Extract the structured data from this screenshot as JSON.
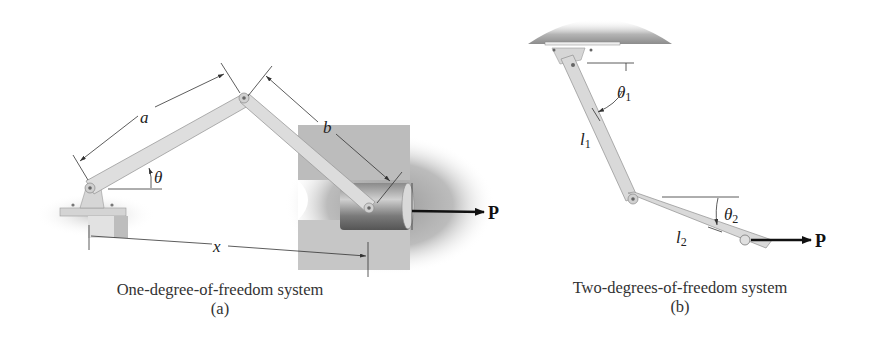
{
  "figure_a": {
    "caption": "One-degree-of-freedom system",
    "sublabel": "(a)",
    "labels": {
      "link1": "a",
      "link2": "b",
      "angle": "θ",
      "distance": "x",
      "force": "P"
    }
  },
  "figure_b": {
    "caption": "Two-degrees-of-freedom system",
    "sublabel": "(b)",
    "labels": {
      "angle1": "θ",
      "angle1_sub": "1",
      "link1": "l",
      "link1_sub": "1",
      "angle2": "θ",
      "angle2_sub": "2",
      "link2": "l",
      "link2_sub": "2",
      "force": "P"
    }
  },
  "colors": {
    "link": "#d9d9d9",
    "link_edge": "#9a9a9a",
    "ground": "#a8a8a8",
    "text": "#222222",
    "arrow": "#111111"
  }
}
